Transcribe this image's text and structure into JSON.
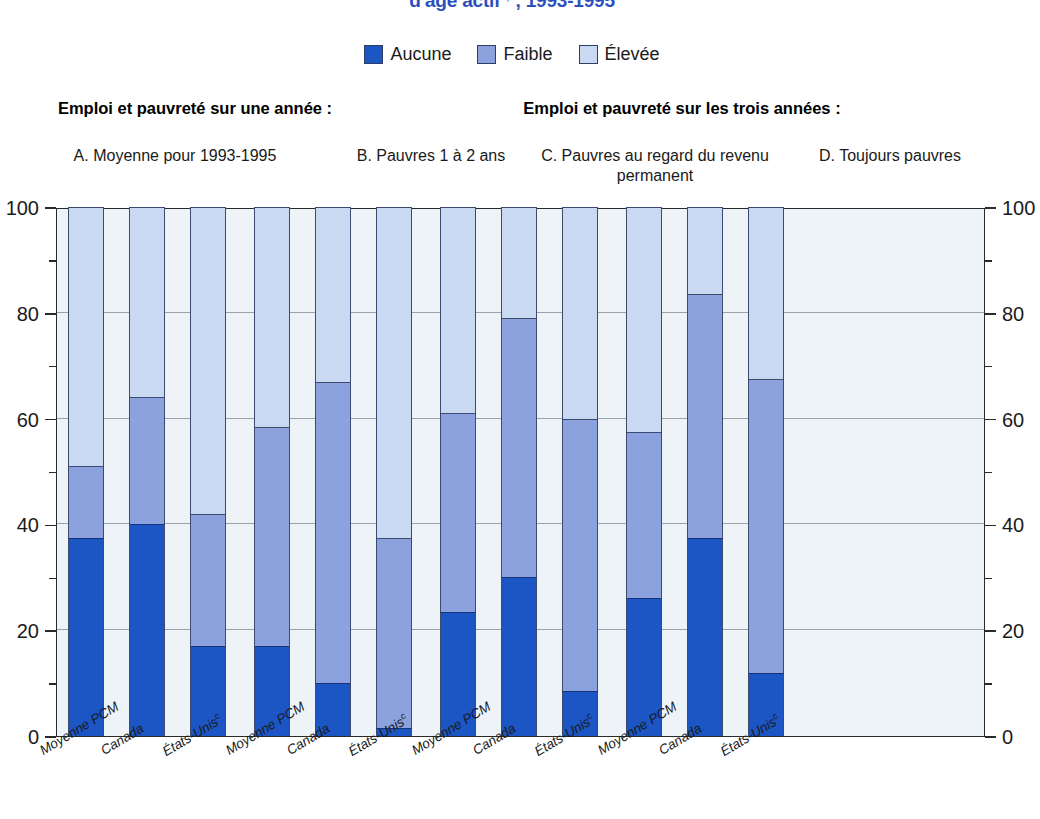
{
  "title": {
    "text": "d'âge actif",
    "superscript": "a,b",
    "years": ", 1993-1995",
    "color": "#2b4fbe"
  },
  "legend": {
    "items": [
      {
        "label": "Aucune",
        "color": "#1b56c4",
        "icon": "legend-swatch"
      },
      {
        "label": "Faible",
        "color": "#8ca2de",
        "icon": "legend-swatch"
      },
      {
        "label": "Élevée",
        "color": "#c9d9f1",
        "icon": "legend-swatch"
      }
    ]
  },
  "section_headers": {
    "left": "Emploi et pauvreté sur une année :",
    "right": "Emploi et pauvreté sur les trois années :"
  },
  "panel_titles": {
    "a": "A. Moyenne pour 1993-1995",
    "b": "B. Pauvres 1 à 2 ans",
    "c": "C. Pauvres au regard du revenu permanent",
    "d": "D. Toujours pauvres"
  },
  "axis": {
    "y_ticks": [
      "0",
      "20",
      "40",
      "60",
      "80",
      "100"
    ],
    "y_min": 0,
    "y_max": 100,
    "minor_step": 10,
    "x_labels": [
      "Moyenne PCM",
      "Canada",
      "États-Unis"
    ],
    "x_label_superscript": "c"
  },
  "chart_data": {
    "type": "bar",
    "xlabel": "",
    "ylabel": "",
    "ylim": [
      0,
      100
    ],
    "grid": true,
    "stacked": true,
    "legend_position": "top-center",
    "categories": [
      "A. Moyenne pour 1993-1995 — Moyenne PCM",
      "A. Moyenne pour 1993-1995 — Canada",
      "A. Moyenne pour 1993-1995 — États-Unis",
      "B. Pauvres 1 à 2 ans — Moyenne PCM",
      "B. Pauvres 1 à 2 ans — Canada",
      "B. Pauvres 1 à 2 ans — États-Unis",
      "C. Pauvres au regard du revenu permanent — Moyenne PCM",
      "C. Pauvres au regard du revenu permanent — Canada",
      "C. Pauvres au regard du revenu permanent — États-Unis",
      "D. Toujours pauvres — Moyenne PCM",
      "D. Toujours pauvres — Canada",
      "D. Toujours pauvres — États-Unis"
    ],
    "series": [
      {
        "name": "Aucune",
        "color": "#1b56c4",
        "values": [
          37.5,
          40.0,
          17.0,
          17.0,
          10.0,
          1.5,
          23.5,
          30.0,
          8.5,
          26.0,
          37.5,
          12.0
        ]
      },
      {
        "name": "Faible",
        "color": "#8ca2de",
        "values": [
          13.5,
          24.0,
          25.0,
          41.5,
          57.0,
          36.0,
          37.5,
          49.0,
          51.5,
          31.5,
          46.0,
          55.5
        ]
      },
      {
        "name": "Élevée",
        "color": "#c9d9f1",
        "values": [
          49.0,
          36.0,
          58.0,
          41.5,
          33.0,
          62.5,
          39.0,
          21.0,
          40.0,
          42.5,
          16.5,
          32.5
        ]
      }
    ],
    "cumulative_tops": {
      "Aucune": [
        37.5,
        40.0,
        17.0,
        17.0,
        10.0,
        1.5,
        23.5,
        30.0,
        8.5,
        26.0,
        37.5,
        12.0
      ],
      "Faible": [
        51.0,
        64.0,
        42.0,
        58.5,
        67.0,
        37.5,
        61.0,
        79.0,
        60.0,
        57.5,
        83.5,
        67.5
      ],
      "Élevée": [
        100,
        100,
        100,
        100,
        100,
        100,
        100,
        100,
        100,
        100,
        100,
        100
      ]
    },
    "groups": [
      {
        "panel": "A",
        "bars": [
          "Moyenne PCM",
          "Canada",
          "États-Unis"
        ]
      },
      {
        "panel": "B",
        "bars": [
          "Moyenne PCM",
          "Canada",
          "États-Unis"
        ]
      },
      {
        "panel": "C",
        "bars": [
          "Moyenne PCM",
          "Canada",
          "États-Unis"
        ]
      },
      {
        "panel": "D",
        "bars": [
          "Moyenne PCM",
          "Canada",
          "États-Unis"
        ]
      }
    ]
  }
}
